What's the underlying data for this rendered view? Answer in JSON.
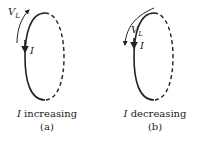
{
  "panels": [
    {
      "id": "a",
      "voltage_label": "V",
      "voltage_subscript": "L",
      "current_label": "I",
      "caption_var": "I",
      "caption_text": "increasing",
      "sublabel": "(a)",
      "vl_arrow_direction": "up"
    },
    {
      "id": "b",
      "voltage_label": "V",
      "voltage_subscript": "L",
      "current_label": "I",
      "caption_var": "I",
      "caption_text": "decreasing",
      "sublabel": "(b)",
      "vl_arrow_direction": "down"
    }
  ]
}
